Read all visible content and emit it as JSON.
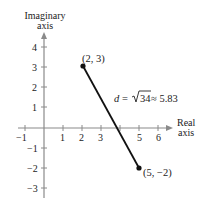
{
  "figure": {
    "type": "complex-plane-distance",
    "axes": {
      "vertical_label_line1": "Imaginary",
      "vertical_label_line2": "axis",
      "horizontal_label_line1": "Real",
      "horizontal_label_line2": "axis",
      "x_ticks": [
        "-1",
        "1",
        "2",
        "3",
        "5",
        "6"
      ],
      "y_ticks": [
        "4",
        "3",
        "2",
        "1",
        "-1",
        "-2",
        "-3"
      ],
      "color": "#8a8a8a"
    },
    "points": [
      {
        "label": "(2, 3)",
        "x": 2,
        "y": 3
      },
      {
        "label": "(5, −2)",
        "x": 5,
        "y": -2
      }
    ],
    "segment": {
      "color": "#111111",
      "distance_var": "d",
      "distance_eq": " = ",
      "radicand": "34",
      "distance_approx": " ≈ 5.83"
    }
  },
  "x_tick_labels": {
    "m1": "−1",
    "p1": "1",
    "p2": "2",
    "p3": "3",
    "p5": "5",
    "p6": "6"
  },
  "y_tick_labels": {
    "p4": "4",
    "p3": "3",
    "p2": "2",
    "p1": "1",
    "m1": "−1",
    "m2": "−2",
    "m3": "−3"
  }
}
